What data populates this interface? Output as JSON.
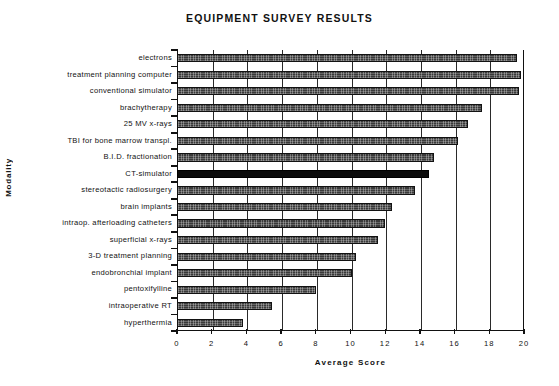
{
  "chart_data": {
    "type": "bar",
    "orientation": "horizontal",
    "title": "EQUIPMENT SURVEY RESULTS",
    "xlabel": "Average Score",
    "ylabel": "Modality",
    "xlim": [
      0,
      20
    ],
    "xticks": [
      0,
      2,
      4,
      6,
      8,
      10,
      12,
      14,
      16,
      18,
      20
    ],
    "xtick_labels": [
      "0",
      "2",
      "4",
      "6",
      "8",
      "10",
      "12",
      "14",
      "16",
      "18",
      "20"
    ],
    "grid": "vertical",
    "legend": "none",
    "categories": [
      "electrons",
      "treatment planning computer",
      "conventional simulator",
      "brachytherapy",
      "25 MV x-rays",
      "TBI for bone marrow transpl.",
      "B.I.D. fractionation",
      "CT-simulator",
      "stereotactic radiosurgery",
      "brain implants",
      "intraop. afterloading catheters",
      "superficial x-rays",
      "3-D treatment planning",
      "endobronchial implant",
      "pentoxifylline",
      "intraoperative RT",
      "hyperthermia"
    ],
    "values": [
      19.6,
      19.8,
      19.7,
      17.6,
      16.8,
      16.2,
      14.8,
      14.5,
      13.7,
      12.4,
      12.0,
      11.6,
      10.3,
      10.1,
      8.0,
      5.5,
      3.8
    ],
    "highlighted_category": "CT-simulator",
    "bar_color": "#3a3a3a",
    "highlight_color": "#0b0b0b"
  }
}
